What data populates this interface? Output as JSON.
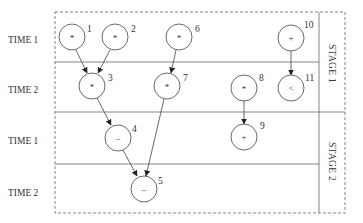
{
  "diagram": {
    "title": "",
    "rows": [
      {
        "label": "TIME 1",
        "y": 40
      },
      {
        "label": "TIME 2",
        "y": 90
      },
      {
        "label": "TIME 1",
        "y": 141
      },
      {
        "label": "TIME 2",
        "y": 193
      }
    ],
    "stages": [
      {
        "label": "STAGE 1"
      },
      {
        "label": "STAGE 2"
      }
    ],
    "nodes": [
      {
        "id": "1",
        "op": "*",
        "cx": 72,
        "cy": 37
      },
      {
        "id": "2",
        "op": "*",
        "cx": 115,
        "cy": 37
      },
      {
        "id": "3",
        "op": "*",
        "cx": 92,
        "cy": 86
      },
      {
        "id": "4",
        "op": "–",
        "cx": 118,
        "cy": 138
      },
      {
        "id": "5",
        "op": "–",
        "cx": 144,
        "cy": 189
      },
      {
        "id": "6",
        "op": "*",
        "cx": 179,
        "cy": 37
      },
      {
        "id": "7",
        "op": "*",
        "cx": 167,
        "cy": 86
      },
      {
        "id": "8",
        "op": "*",
        "cx": 244,
        "cy": 88
      },
      {
        "id": "9",
        "op": "+",
        "cx": 244,
        "cy": 137
      },
      {
        "id": "10",
        "op": "+",
        "cx": 291,
        "cy": 38
      },
      {
        "id": "11",
        "op": "<",
        "cx": 291,
        "cy": 88
      }
    ],
    "edges": [
      {
        "from": "1",
        "to": "3"
      },
      {
        "from": "2",
        "to": "3"
      },
      {
        "from": "3",
        "to": "4"
      },
      {
        "from": "4",
        "to": "5"
      },
      {
        "from": "6",
        "to": "7"
      },
      {
        "from": "7",
        "to": "5"
      },
      {
        "from": "8",
        "to": "9"
      },
      {
        "from": "10",
        "to": "11"
      }
    ],
    "colors": {
      "line": "#555555",
      "text": "#333333",
      "background": "#ffffff"
    }
  }
}
